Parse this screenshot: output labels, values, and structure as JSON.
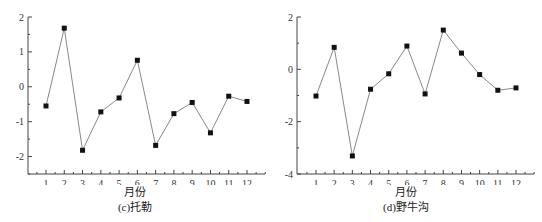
{
  "chart_data": [
    {
      "type": "line",
      "title": "(c)托勒",
      "xlabel": "月份",
      "ylabel": "",
      "categories": [
        "1",
        "2",
        "3",
        "4",
        "5",
        "6",
        "7",
        "8",
        "9",
        "10",
        "11",
        "12"
      ],
      "x": [
        1,
        2,
        3,
        4,
        5,
        6,
        7,
        8,
        9,
        10,
        11,
        12
      ],
      "series": [
        {
          "name": "托勒",
          "values": [
            -0.55,
            1.68,
            -1.82,
            -0.72,
            -0.32,
            0.76,
            -1.68,
            -0.77,
            -0.45,
            -1.32,
            -0.27,
            -0.42
          ]
        }
      ],
      "yticks": [
        2,
        1,
        0,
        -1,
        -2
      ],
      "ytick_labels": [
        "2",
        "1",
        "0",
        "-1",
        "-2"
      ],
      "xlim": [
        0,
        13
      ],
      "ylim": [
        -2.5,
        2
      ],
      "grid": false,
      "legend": "none",
      "marker": "square",
      "line_color": "#888888",
      "marker_color": "#111111"
    },
    {
      "type": "line",
      "title": "(d)野牛沟",
      "xlabel": "月份",
      "ylabel": "",
      "categories": [
        "1",
        "2",
        "3",
        "4",
        "5",
        "6",
        "7",
        "8",
        "9",
        "10",
        "11",
        "12"
      ],
      "x": [
        1,
        2,
        3,
        4,
        5,
        6,
        7,
        8,
        9,
        10,
        11,
        12
      ],
      "series": [
        {
          "name": "野牛沟",
          "values": [
            -1.02,
            0.84,
            -3.31,
            -0.76,
            -0.17,
            0.89,
            -0.94,
            1.5,
            0.62,
            -0.2,
            -0.8,
            -0.71
          ]
        }
      ],
      "yticks": [
        2,
        0,
        -2,
        -4
      ],
      "ytick_labels": [
        "2",
        "0",
        "-2",
        "-4"
      ],
      "xlim": [
        0,
        13
      ],
      "ylim": [
        -4,
        2
      ],
      "grid": false,
      "legend": "none",
      "marker": "square",
      "line_color": "#888888",
      "marker_color": "#111111"
    }
  ],
  "panels": {
    "c": {
      "xlabel": "月份",
      "caption": "(c)托勒"
    },
    "d": {
      "xlabel": "月份",
      "caption": "(d)野牛沟"
    }
  }
}
